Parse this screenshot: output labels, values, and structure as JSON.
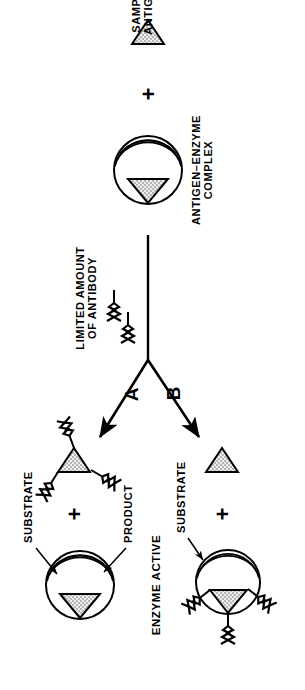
{
  "figure": {
    "colors": {
      "ink": "#000000",
      "paper": "#ffffff",
      "stipple_fill": "#d9d9d9"
    },
    "labels": {
      "sample_antigen": "SAMPLE\nANTIGEN",
      "sample_antigen_line1": "SAMPLE",
      "sample_antigen_line2": "ANTIGEN",
      "antigen_enzyme_complex_line1": "ANTIGEN–ENZYME",
      "antigen_enzyme_complex_line2": "COMPLEX",
      "limited_antibody_line1": "LIMITED AMOUNT",
      "limited_antibody_line2": "OF ANTIBODY",
      "branch_a": "A",
      "branch_b": "B",
      "enzyme_active": "ENZYME ACTIVE",
      "substrate_top": "SUBSTRATE",
      "product_top": "PRODUCT",
      "substrate_bottom": "SUBSTRATE",
      "plus_sign": "+"
    },
    "elements": {
      "sample_antigen_shape": "stippled-triangle",
      "enzyme_shape": "circle-with-active-site-lens",
      "antibody_shape": "y-shaped-zigzag",
      "branch_arrow": "arrow"
    }
  }
}
